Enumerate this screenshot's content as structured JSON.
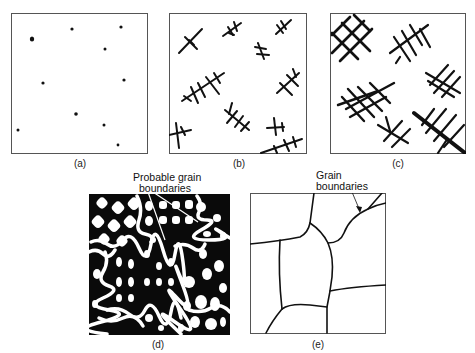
{
  "figure": {
    "panels": [
      {
        "id": "a",
        "caption": "(a)",
        "description": "Isolated nuclei (small dots) in liquid"
      },
      {
        "id": "b",
        "caption": "(b)",
        "description": "Dendrites begin growing from nuclei"
      },
      {
        "id": "c",
        "caption": "(c)",
        "description": "Dendrites grow and branch"
      },
      {
        "id": "d",
        "caption": "(d)",
        "description": "Solidification complete; dendrites meet",
        "annotation": "Probable grain\nboundaries",
        "annotation_line1": "Probable grain",
        "annotation_line2": "boundaries"
      },
      {
        "id": "e",
        "caption": "(e)",
        "description": "Final grain structure",
        "annotation": "Grain\nboundaries",
        "annotation_line1": "Grain",
        "annotation_line2": "boundaries"
      }
    ],
    "colors": {
      "ink": "#111111",
      "background": "#ffffff",
      "frame": "#555555"
    }
  }
}
